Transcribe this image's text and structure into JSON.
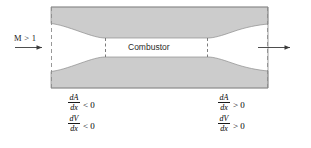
{
  "figure": {
    "type": "supersonic-combustor-duct-schematic",
    "background_color": "#ffffff",
    "duct_fill_color": "#cccccc",
    "line_color": "#808080",
    "text_color": "#1a1a1a"
  },
  "inlet": {
    "mach_label": "M > 1",
    "arrow_name": "inlet-flow-arrow",
    "arrow_direction": "right"
  },
  "chamber": {
    "label": "Combustor"
  },
  "outlet": {
    "arrow_name": "outlet-flow-arrow",
    "arrow_direction": "right"
  },
  "annotations": {
    "left": {
      "name": "converging-section-derivatives",
      "rows": [
        {
          "numerator": "dA",
          "denominator": "dx",
          "relation": "< 0"
        },
        {
          "numerator": "dV",
          "denominator": "dx",
          "relation": "< 0"
        }
      ]
    },
    "right": {
      "name": "diverging-section-derivatives",
      "rows": [
        {
          "numerator": "dA",
          "denominator": "dx",
          "relation": "> 0"
        },
        {
          "numerator": "dV",
          "denominator": "dx",
          "relation": "> 0"
        }
      ]
    }
  },
  "geometry": {
    "duct_left_x": 51,
    "duct_right_x": 268,
    "duct_top_y": 7,
    "duct_bottom_y": 88,
    "combustor_left_x": 105,
    "combustor_right_x": 208,
    "throat_top_y": 38,
    "throat_bottom_y": 57
  }
}
